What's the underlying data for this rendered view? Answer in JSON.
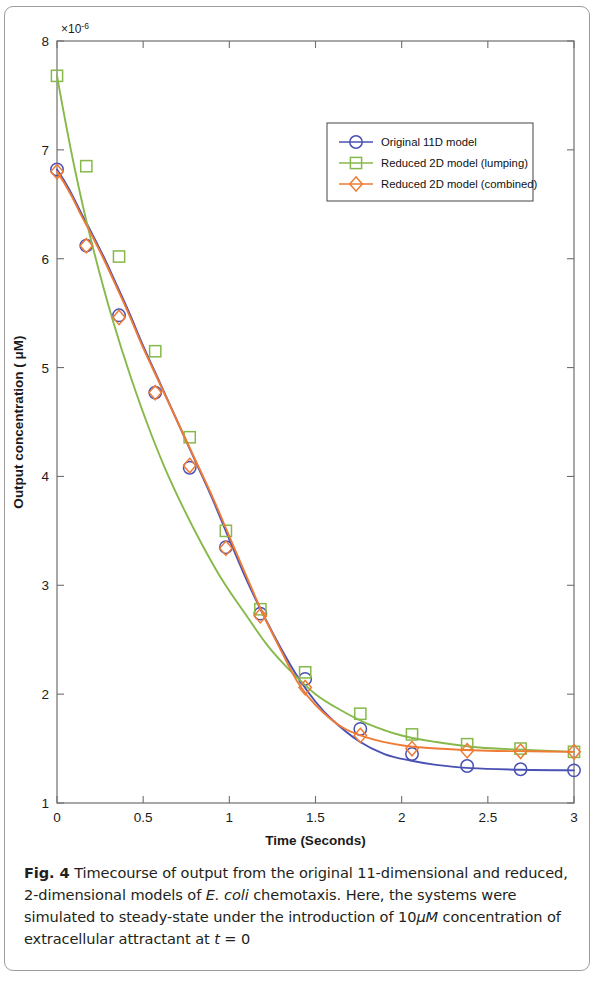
{
  "figure": {
    "label": "Fig. 4",
    "caption_parts": {
      "p1": " Timecourse of output from the original 11-dimensional and reduced, 2-dimensional models of ",
      "italic1": "E. coli",
      "p2": " chemotaxis. Here, the systems were simulated to steady-state under the introduction of 10",
      "italic2": "μM",
      "p3": " concentration of extracellular attractant at ",
      "italic3": "t",
      "p4": " = 0"
    },
    "caption_full": "Fig. 4 Timecourse of output from the original 11-dimensional and reduced, 2-dimensional models of E. coli chemotaxis. Here, the systems were simulated to steady-state under the introduction of 10μM concentration of extracellular attractant at t = 0"
  },
  "chart_data": {
    "type": "line",
    "title": "",
    "xlabel": "Time (Seconds)",
    "ylabel": "Output concentration ( μM)",
    "y_exponent_label": "×10",
    "y_exponent_value": "-6",
    "xlim": [
      0,
      3
    ],
    "ylim": [
      1,
      8
    ],
    "xticks": [
      0,
      0.5,
      1,
      1.5,
      2,
      2.5,
      3
    ],
    "xticklabels": [
      "0",
      "0.5",
      "1",
      "1.5",
      "2",
      "2.5",
      "3"
    ],
    "yticks": [
      1,
      2,
      3,
      4,
      5,
      6,
      7,
      8
    ],
    "yticklabels": [
      "1",
      "2",
      "3",
      "4",
      "5",
      "6",
      "7",
      "8"
    ],
    "grid": false,
    "legend_position": "upper right",
    "series": [
      {
        "name": "Original 11D model",
        "color": "#4a51b5",
        "marker": "circle",
        "x": [
          0,
          0.04,
          0.09,
          0.14,
          0.2,
          0.27,
          0.34,
          0.42,
          0.5,
          0.6,
          0.7,
          0.8,
          0.9,
          1.0,
          1.1,
          1.2,
          1.3,
          1.4,
          1.5,
          1.6,
          1.75,
          1.9,
          2.05,
          2.2,
          2.4,
          2.7,
          3.0
        ],
        "y": [
          6.82,
          6.72,
          6.58,
          6.42,
          6.24,
          6.02,
          5.78,
          5.5,
          5.2,
          4.85,
          4.5,
          4.15,
          3.8,
          3.42,
          3.05,
          2.72,
          2.42,
          2.15,
          1.93,
          1.76,
          1.57,
          1.45,
          1.39,
          1.35,
          1.32,
          1.305,
          1.3
        ],
        "markers_x": [
          0,
          0.17,
          0.36,
          0.57,
          0.77,
          0.98,
          1.18,
          1.44,
          1.76,
          2.06,
          2.38,
          2.69,
          3.0
        ],
        "markers_y": [
          6.82,
          6.12,
          5.48,
          4.77,
          4.08,
          3.35,
          2.74,
          2.14,
          1.68,
          1.45,
          1.34,
          1.31,
          1.3
        ]
      },
      {
        "name": "Reduced 2D model (lumping)",
        "color": "#86b94a",
        "marker": "square",
        "x": [
          0,
          0.05,
          0.1,
          0.17,
          0.25,
          0.33,
          0.42,
          0.52,
          0.62,
          0.73,
          0.85,
          0.97,
          1.1,
          1.22,
          1.35,
          1.5,
          1.65,
          1.8,
          2.0,
          2.2,
          2.45,
          2.7,
          3.0
        ],
        "y": [
          7.68,
          7.25,
          6.85,
          6.35,
          5.85,
          5.4,
          4.95,
          4.5,
          4.1,
          3.72,
          3.35,
          3.02,
          2.72,
          2.45,
          2.22,
          2.0,
          1.85,
          1.73,
          1.62,
          1.56,
          1.51,
          1.49,
          1.47
        ],
        "markers_x": [
          0,
          0.17,
          0.36,
          0.57,
          0.77,
          0.98,
          1.18,
          1.44,
          1.76,
          2.06,
          2.38,
          2.69,
          3.0
        ],
        "markers_y": [
          7.68,
          6.85,
          6.02,
          5.15,
          4.36,
          3.5,
          2.78,
          2.2,
          1.82,
          1.63,
          1.54,
          1.5,
          1.47
        ]
      },
      {
        "name": "Reduced 2D model (combined)",
        "color": "#ef7b35",
        "marker": "diamond",
        "x": [
          0,
          0.04,
          0.09,
          0.14,
          0.2,
          0.27,
          0.34,
          0.42,
          0.5,
          0.6,
          0.7,
          0.8,
          0.9,
          1.0,
          1.1,
          1.2,
          1.3,
          1.4,
          1.5,
          1.65,
          1.8,
          2.0,
          2.2,
          2.5,
          2.75,
          3.0
        ],
        "y": [
          6.8,
          6.7,
          6.56,
          6.4,
          6.22,
          6.0,
          5.76,
          5.48,
          5.18,
          4.84,
          4.5,
          4.16,
          3.82,
          3.45,
          3.08,
          2.72,
          2.4,
          2.1,
          1.9,
          1.7,
          1.6,
          1.53,
          1.5,
          1.48,
          1.475,
          1.47
        ],
        "markers_x": [
          0,
          0.17,
          0.36,
          0.57,
          0.77,
          0.98,
          1.18,
          1.44,
          1.76,
          2.06,
          2.38,
          2.69,
          3.0
        ],
        "markers_y": [
          6.8,
          6.12,
          5.46,
          4.77,
          4.1,
          3.34,
          2.72,
          2.06,
          1.62,
          1.5,
          1.48,
          1.475,
          1.47
        ]
      }
    ]
  }
}
